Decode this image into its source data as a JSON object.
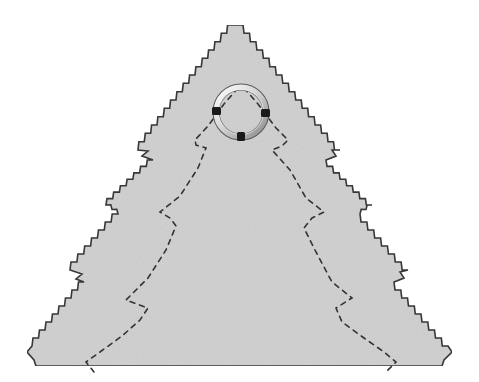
{
  "image": {
    "subject": "felt Christmas tree ornament cut-out with pinked edges",
    "caption": "Felt tree ornament template",
    "colors": {
      "background": "#ffffff",
      "felt": "#d3d3d3",
      "outline": "#3a3a3a",
      "stitch": "#333333",
      "ring_light": "#f2f2f2",
      "ring_mid": "#b8b8b8",
      "ring_dark": "#555555",
      "clamp": "#1a1a1a"
    },
    "elements": [
      {
        "name": "tree-shape",
        "description": "Stepped four-tier tree silhouette with zig-zag pinked edges"
      },
      {
        "name": "hanging-ring",
        "description": "Metal split ring at the apex with three dark clamps"
      },
      {
        "name": "stitch-line",
        "description": "Dashed stitching line inset from the outline"
      }
    ]
  }
}
